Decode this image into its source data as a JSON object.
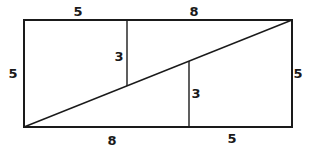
{
  "diagram": {
    "type": "geometry-dissection",
    "stroke_color": "#1a1a1a",
    "background_color": "#ffffff",
    "rectangle": {
      "width_units": 13,
      "height_units": 5
    },
    "labels": {
      "top_left_segment": "5",
      "top_right_segment": "8",
      "left_side": "5",
      "right_side": "5",
      "inner_left_vertical": "3",
      "inner_right_vertical": "3",
      "bottom_left_segment": "8",
      "bottom_right_segment": "5"
    }
  }
}
